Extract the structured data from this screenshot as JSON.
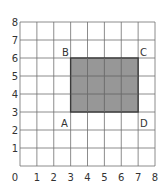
{
  "grid": {
    "x_min": 0,
    "x_max": 8,
    "y_min": 0,
    "y_max": 8,
    "x_ticks": [
      "0",
      "1",
      "2",
      "3",
      "4",
      "5",
      "6",
      "7",
      "8"
    ],
    "y_ticks": [
      "1",
      "2",
      "3",
      "4",
      "5",
      "6",
      "7",
      "8"
    ],
    "line_color": "#6e6e6e"
  },
  "rectangle": {
    "fill": "#8c8c8c",
    "stroke": "#3a3a3a",
    "vertices": [
      {
        "label": "A",
        "x": 3,
        "y": 3
      },
      {
        "label": "B",
        "x": 3,
        "y": 6
      },
      {
        "label": "C",
        "x": 7,
        "y": 6
      },
      {
        "label": "D",
        "x": 7,
        "y": 3
      }
    ]
  },
  "labels": {
    "A": "A",
    "B": "B",
    "C": "C",
    "D": "D"
  }
}
